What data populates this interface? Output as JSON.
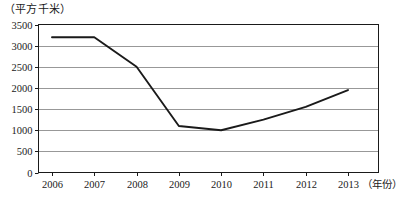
{
  "chart_data": {
    "type": "line",
    "title": "",
    "unit_label": "（平方千米）",
    "xlabel": "（年份）",
    "ylabel": "",
    "categories": [
      "2006",
      "2007",
      "2008",
      "2009",
      "2010",
      "2011",
      "2012",
      "2013"
    ],
    "values": [
      3200,
      3200,
      2500,
      1100,
      1000,
      1250,
      1550,
      1950
    ],
    "series": [
      {
        "name": "",
        "values": [
          3200,
          3200,
          2500,
          1100,
          1000,
          1250,
          1550,
          1950
        ]
      }
    ],
    "ylim": [
      0,
      3500
    ],
    "yticks": [
      0,
      500,
      1000,
      1500,
      2000,
      2500,
      3000,
      3500
    ],
    "ytick_labels": [
      "0",
      "500",
      "1000",
      "1500",
      "2000",
      "2500",
      "3000",
      "3500"
    ],
    "xtick_labels": [
      "2006",
      "2007",
      "2008",
      "2009",
      "2010",
      "2011",
      "2012",
      "2013"
    ],
    "grid": true,
    "grid_axis": "y",
    "legend": false,
    "legend_position": "none",
    "line_color": "#1a1a1a",
    "grid_color": "#8c8c8c",
    "axis_color": "#1a1a1a",
    "background_color": "#ffffff"
  }
}
